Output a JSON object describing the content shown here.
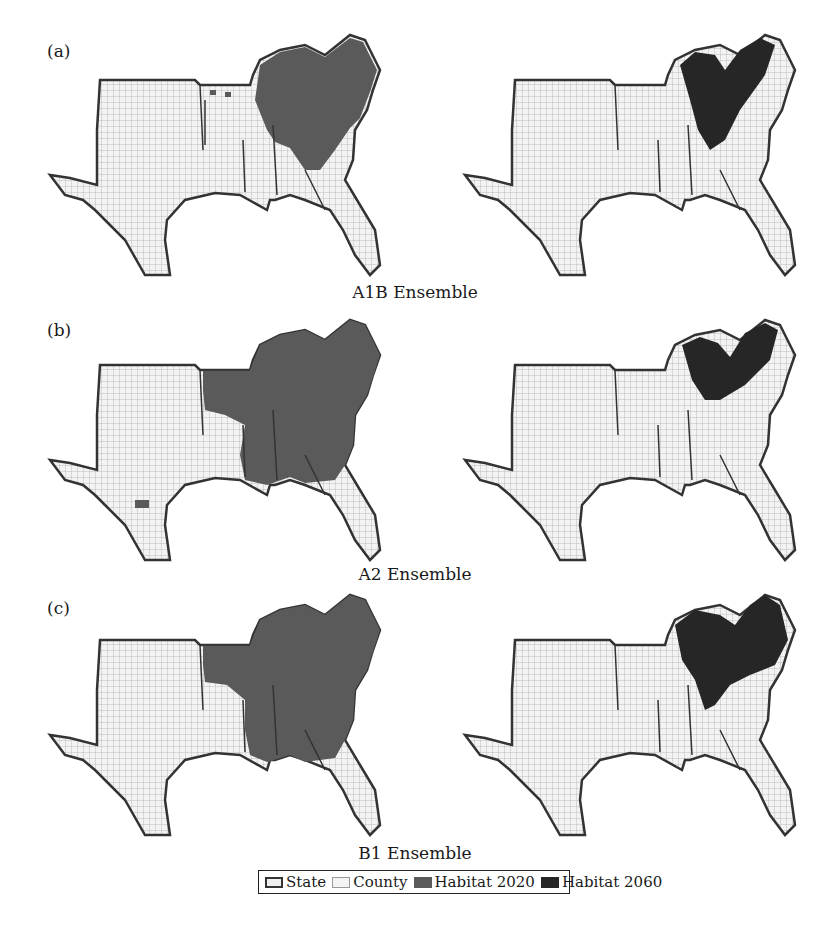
{
  "figure": {
    "panels": [
      {
        "label": "(a)",
        "caption": "A1B Ensemble",
        "left_map": {
          "period": "2020",
          "habitat_extent": "northeast-heavy: KY, TN, VA, NC, north AL/GA, small patches AR"
        },
        "right_map": {
          "period": "2060",
          "habitat_extent": "Appalachian core: eastern KY, VA, WV region, NE TN"
        }
      },
      {
        "label": "(b)",
        "caption": "A2 Ensemble",
        "left_map": {
          "period": "2020",
          "habitat_extent": "broad: KY, TN, VA, NC, SC, GA, AL, MS, northern AR, patch in central TX"
        },
        "right_map": {
          "period": "2060",
          "habitat_extent": "Appalachian core: eastern KY, VA, NE TN"
        }
      },
      {
        "label": "(c)",
        "caption": "B1 Ensemble",
        "left_map": {
          "period": "2020",
          "habitat_extent": "broad: KY, TN, VA, NC, SC, GA, AL, MS, northern AR, FL panhandle"
        },
        "right_map": {
          "period": "2060",
          "habitat_extent": "KY, VA, TN, western NC, north GA"
        }
      }
    ],
    "legend": {
      "items": [
        {
          "label": "State",
          "swatch": "state"
        },
        {
          "label": "County",
          "swatch": "county"
        },
        {
          "label": "Habitat 2020",
          "swatch": "h2020",
          "color": "#5a5a5a"
        },
        {
          "label": "Habitat 2060",
          "swatch": "h2060",
          "color": "#262626"
        }
      ]
    },
    "colors": {
      "state_border": "#333333",
      "county_fill": "#eeeeee",
      "county_line": "#aaaaaa",
      "habitat_2020": "#5a5a5a",
      "habitat_2060": "#262626"
    }
  }
}
